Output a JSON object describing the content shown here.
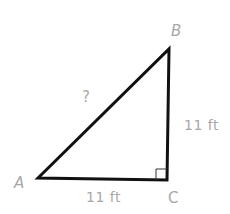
{
  "diagram": {
    "type": "right-triangle",
    "vertices": {
      "A": {
        "label": "A",
        "x": 38,
        "y": 178
      },
      "B": {
        "label": "B",
        "x": 169,
        "y": 49
      },
      "C": {
        "label": "C",
        "x": 167,
        "y": 180
      }
    },
    "sides": {
      "AC": {
        "label": "11 ft"
      },
      "BC": {
        "label": "11 ft"
      },
      "AB": {
        "label": "?"
      }
    },
    "right_angle_at": "C",
    "colors": {
      "stroke": "#111111",
      "label": "#a8a8a8",
      "background": "#ffffff"
    }
  }
}
